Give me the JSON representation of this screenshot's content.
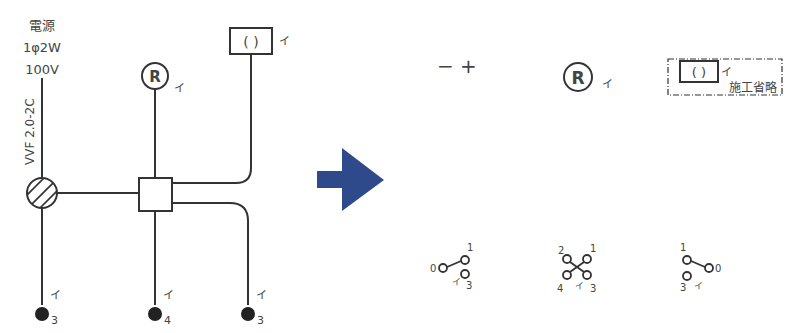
{
  "left_diagram": {
    "source_label": "電源",
    "source_spec": "1φ2W",
    "source_voltage": "100V",
    "cable_label": "VVF 2.0-2C",
    "receptacle_symbol": "R",
    "receptacle_label": "イ",
    "lamp_symbol": "( )",
    "lamp_label": "イ",
    "switches": [
      {
        "label": "イ",
        "type": "3"
      },
      {
        "label": "イ",
        "type": "4"
      },
      {
        "label": "イ",
        "type": "3"
      }
    ]
  },
  "arrow": {
    "color": "#2e4a8a"
  },
  "right_diagram": {
    "polarity": "− +",
    "receptacle_symbol": "R",
    "receptacle_label": "イ",
    "lamp_symbol": "( )",
    "lamp_label": "イ",
    "omit_label": "施工省略",
    "switches": [
      {
        "name": "3-way-left",
        "terminals": [
          "0",
          "1",
          "3"
        ],
        "label": "イ"
      },
      {
        "name": "4-way",
        "terminals": [
          "2",
          "1",
          "4",
          "3"
        ],
        "label": "イ"
      },
      {
        "name": "3-way-right",
        "terminals": [
          "1",
          "0",
          "3"
        ],
        "label": "イ"
      }
    ]
  }
}
